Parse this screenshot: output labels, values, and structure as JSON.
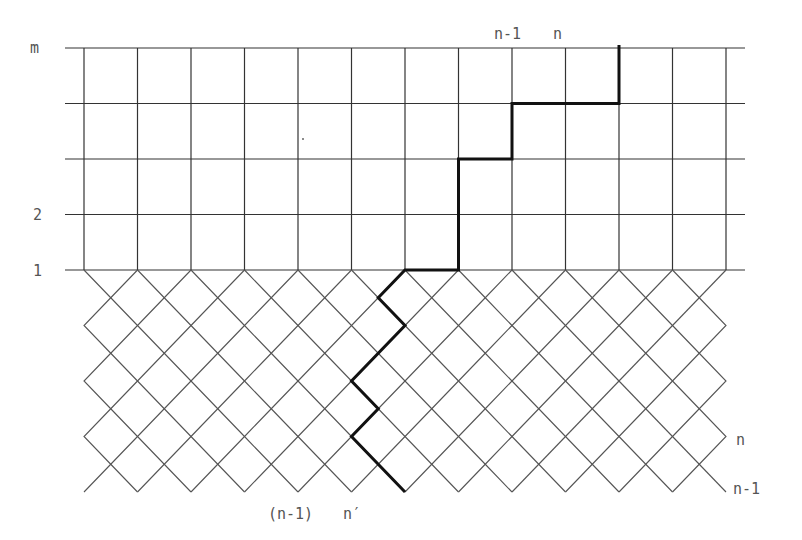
{
  "diagram": {
    "title": "",
    "grid": {
      "columns_x": [
        84,
        137.5,
        191,
        244.5,
        298,
        351.5,
        405,
        458.5,
        512,
        565.5,
        619,
        672.5,
        726
      ],
      "rows_y": [
        48,
        103.5,
        159,
        214.5,
        270
      ],
      "line_x_start": 65,
      "line_x_end": 745
    },
    "lattice": {
      "x_left": 84,
      "x_right": 726,
      "y_top": 270,
      "y_bottom": 492,
      "half_dx": 26.75,
      "half_dy": 27.75
    },
    "heavy_path": [
      [
        405,
        492
      ],
      [
        351.5,
        436.5
      ],
      [
        378.25,
        408.75
      ],
      [
        351.5,
        381
      ],
      [
        405,
        325.5
      ],
      [
        378.25,
        297.75
      ],
      [
        405,
        270
      ],
      [
        458.5,
        270
      ],
      [
        458.5,
        159
      ],
      [
        512,
        159
      ],
      [
        512,
        103.5
      ],
      [
        619,
        103.5
      ],
      [
        619,
        45
      ]
    ],
    "stray_dot": [
      303,
      139
    ],
    "labels": {
      "row_m": "m",
      "row_2": "2",
      "row_1": "1",
      "top_n_minus_1": "n-1",
      "top_n": "n",
      "right_n": "n",
      "right_n_minus_1": "n-1",
      "bottom_n_minus_1": "(n-1)",
      "bottom_n_prime": "n′"
    }
  }
}
